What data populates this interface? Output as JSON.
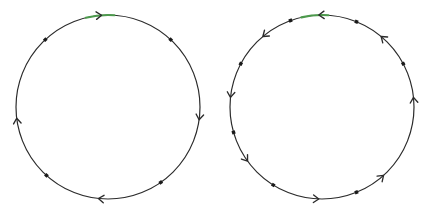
{
  "figure": {
    "width": 424,
    "height": 213,
    "background_color": "#ffffff",
    "colors": {
      "path": "#2b2b2b",
      "path_highlight": "#4d9a4d",
      "marker": "#1a1a1a",
      "arrow": "#2b2b2b"
    },
    "stroke_width": 1.2,
    "marker_size": 3.4,
    "arrow_size": 6.5
  },
  "chart_data": {
    "type": "scatter",
    "xlabel": "",
    "ylabel": "",
    "xlim": [
      0,
      424
    ],
    "ylim": [
      0,
      213
    ],
    "grid": false,
    "legend": "none",
    "series": [
      {
        "name": "left-circle",
        "shape": "circle",
        "center": [
          108,
          107
        ],
        "radius": 92,
        "direction": "clockwise",
        "highlight_arc_deg": [
          86,
          104
        ],
        "markers": [
          {
            "kind": "dot",
            "angle_deg": 133
          },
          {
            "kind": "dot",
            "angle_deg": 47
          },
          {
            "kind": "arrow",
            "angle_deg": 94,
            "heading": "cw"
          },
          {
            "kind": "arrow",
            "angle_deg": 187,
            "heading": "cw"
          },
          {
            "kind": "arrow",
            "angle_deg": 352,
            "heading": "cw"
          },
          {
            "kind": "arrow",
            "angle_deg": 264,
            "heading": "cw"
          },
          {
            "kind": "dot",
            "angle_deg": 228
          },
          {
            "kind": "dot",
            "angle_deg": 305
          }
        ]
      },
      {
        "name": "right-circle",
        "shape": "circle",
        "center": [
          322,
          107
        ],
        "radius": 92,
        "direction": "counterclockwise",
        "highlight_arc_deg": [
          86,
          103
        ],
        "markers": [
          {
            "kind": "arrow",
            "angle_deg": 92,
            "heading": "ccw"
          },
          {
            "kind": "dot",
            "angle_deg": 110
          },
          {
            "kind": "arrow",
            "angle_deg": 130,
            "heading": "ccw"
          },
          {
            "kind": "dot",
            "angle_deg": 152
          },
          {
            "kind": "arrow",
            "angle_deg": 174,
            "heading": "ccw"
          },
          {
            "kind": "dot",
            "angle_deg": 196
          },
          {
            "kind": "arrow",
            "angle_deg": 216,
            "heading": "ccw"
          },
          {
            "kind": "dot",
            "angle_deg": 238
          },
          {
            "kind": "arrow",
            "angle_deg": 268,
            "heading": "ccw"
          },
          {
            "kind": "dot",
            "angle_deg": 292
          },
          {
            "kind": "arrow",
            "angle_deg": 312,
            "heading": "ccw"
          },
          {
            "kind": "dot",
            "angle_deg": 68
          },
          {
            "kind": "arrow",
            "angle_deg": 50,
            "heading": "ccw"
          },
          {
            "kind": "dot",
            "angle_deg": 28
          },
          {
            "kind": "arrow",
            "angle_deg": 6,
            "heading": "ccw"
          }
        ]
      }
    ]
  }
}
